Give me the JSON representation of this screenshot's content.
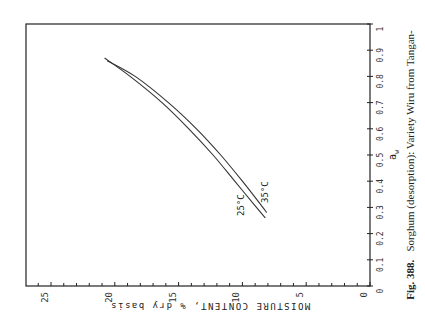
{
  "chart_data": {
    "type": "line",
    "orientation": "rotated 90° (x-axis vertical on right, y-axis horizontal at bottom read inverted)",
    "title": "",
    "xlabel": "a_w",
    "ylabel": "MOISTURE CONTENT, % dry basis",
    "xlim": [
      0,
      1
    ],
    "ylim": [
      0,
      27
    ],
    "x_ticks": [
      "0",
      "0.1",
      "0.2",
      "0.3",
      "0.4",
      "0.5",
      "0.6",
      "0.7",
      "0.8",
      "0.9",
      "1"
    ],
    "y_ticks": [
      "0",
      "5",
      "10",
      "15",
      "20",
      "25"
    ],
    "grid": false,
    "note": "Endpoint values are read from the figure; intermediate aw 0.3-0.8 values are interpolated along the traced curves, not read from labelled points.",
    "series": [
      {
        "name": "25°C",
        "x": [
          0.26,
          0.3,
          0.4,
          0.5,
          0.6,
          0.7,
          0.8,
          0.87
        ],
        "values": [
          8.2,
          8.9,
          10.6,
          12.3,
          14.2,
          16.3,
          18.8,
          20.8
        ],
        "interpolated": [
          false,
          true,
          true,
          true,
          true,
          true,
          true,
          false
        ]
      },
      {
        "name": "35°C",
        "x": [
          0.28,
          0.3,
          0.4,
          0.5,
          0.6,
          0.7,
          0.8,
          0.86
        ],
        "values": [
          8.1,
          8.4,
          10.0,
          11.7,
          13.6,
          15.8,
          18.4,
          20.6
        ],
        "interpolated": [
          false,
          true,
          true,
          true,
          true,
          true,
          true,
          false
        ]
      }
    ],
    "annotations": [
      "25°C",
      "35°C"
    ]
  },
  "labels": {
    "x_axis_label": "a",
    "x_axis_sub": "w",
    "y_axis_label": "MOISTURE CONTENT, % dry basis",
    "curve_25": "25°C",
    "curve_35": "35°C"
  },
  "caption": {
    "fig": "Fig. 388.",
    "text": "Sorghum (desorption): Variety Wiru from Tangan-"
  }
}
